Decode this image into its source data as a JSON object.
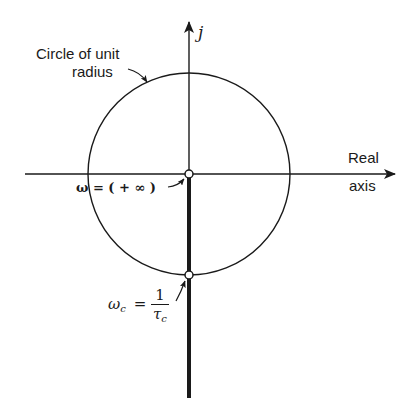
{
  "diagram": {
    "type": "complex-plane-polar-plot",
    "labels": {
      "circle_label_line1": "Circle of unit",
      "circle_label_line2": "radius",
      "imag_axis": "j",
      "real_axis_line1": "Real",
      "real_axis_line2": "axis",
      "omega_inf_prefix": "ω = ( + ∞ )",
      "omega_c_symbol": "ω",
      "omega_c_sub": "c",
      "omega_c_eq": "=",
      "frac_num": "1",
      "frac_den_symbol": "τ",
      "frac_den_sub": "c"
    },
    "geometry": {
      "origin": [
        189,
        174
      ],
      "unit_radius_px": 101,
      "real_axis": {
        "x_start": 25,
        "x_end": 395,
        "y": 174
      },
      "imag_axis": {
        "x": 189,
        "y_top": 22
      },
      "locus": {
        "from": [
          189,
          174
        ],
        "to": [
          189,
          398
        ],
        "note": "thick line along negative j axis"
      },
      "marked_points": [
        {
          "name": "omega-infinity",
          "at": [
            189,
            174
          ]
        },
        {
          "name": "omega-c",
          "at": [
            189,
            275
          ]
        }
      ]
    },
    "colors": {
      "stroke": "#1a1a1a",
      "background": "#ffffff"
    }
  }
}
